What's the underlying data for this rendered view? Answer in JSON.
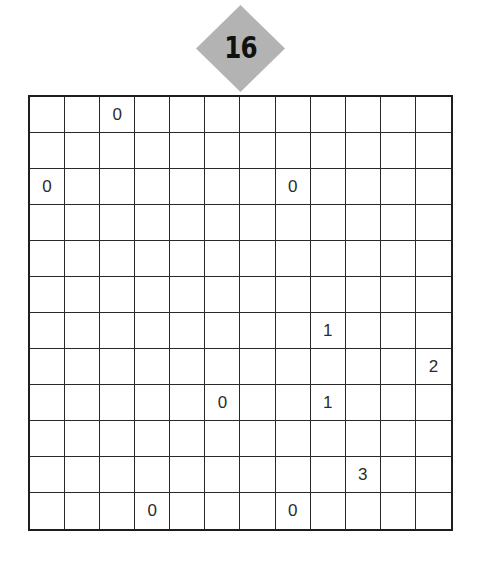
{
  "puzzle": {
    "number": "16",
    "badge_color": "#b3b3b3",
    "rows": 12,
    "cols": 12,
    "clues": [
      {
        "row": 0,
        "col": 2,
        "value": "0"
      },
      {
        "row": 2,
        "col": 0,
        "value": "0"
      },
      {
        "row": 2,
        "col": 7,
        "value": "0"
      },
      {
        "row": 6,
        "col": 8,
        "value": "1"
      },
      {
        "row": 7,
        "col": 11,
        "value": "2"
      },
      {
        "row": 8,
        "col": 5,
        "value": "0"
      },
      {
        "row": 8,
        "col": 8,
        "value": "1"
      },
      {
        "row": 10,
        "col": 9,
        "value": "3"
      },
      {
        "row": 11,
        "col": 3,
        "value": "0"
      },
      {
        "row": 11,
        "col": 7,
        "value": "0"
      }
    ]
  }
}
